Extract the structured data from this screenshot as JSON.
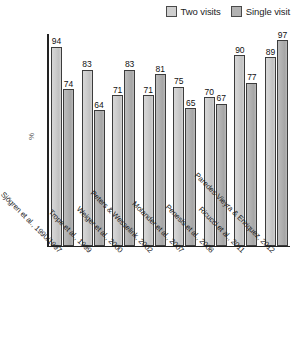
{
  "chart": {
    "ylabel": "%",
    "legend": [
      {
        "label": "Two visits",
        "key": "two",
        "color": "#cfcfcf",
        "swatch": "legend-swatch-two-visits"
      },
      {
        "label": "Single visit",
        "key": "single",
        "color": "#b2b2b2",
        "swatch": "legend-swatch-single-visit"
      }
    ]
  },
  "chart_data": {
    "type": "bar",
    "title": "",
    "xlabel": "",
    "ylabel": "%",
    "ylim": [
      0,
      100
    ],
    "grid": false,
    "legend_position": "top-right",
    "categories": [
      "Sjögren et al., 1990/1997",
      "Trope et al., 1999",
      "Weiger et al., 2000",
      "Peters & Wesselink, 2002",
      "Molander et al., 2007",
      "Penesis et al., 2008",
      "Ricucci et al., 2011",
      "Paredes-Vieyra & Enriquez, 2012"
    ],
    "series": [
      {
        "name": "Two visits",
        "values": [
          94,
          83,
          71,
          71,
          75,
          70,
          90,
          89
        ]
      },
      {
        "name": "Single visit",
        "values": [
          74,
          64,
          83,
          81,
          65,
          67,
          77,
          97
        ]
      }
    ]
  }
}
